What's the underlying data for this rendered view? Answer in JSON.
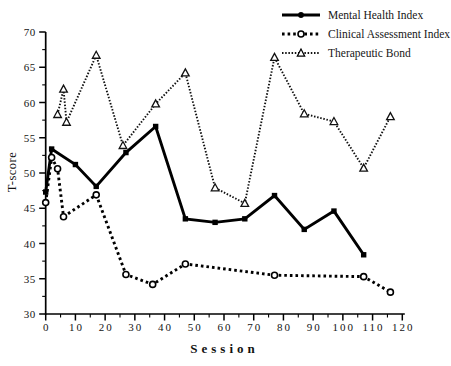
{
  "figure": {
    "background": "#ffffff",
    "ink": "#000000"
  },
  "chart_data": {
    "type": "line",
    "title": "",
    "xlabel": "Session",
    "ylabel": "T-score",
    "xlim": [
      0,
      120
    ],
    "ylim": [
      30,
      70
    ],
    "xticks": [
      0,
      10,
      20,
      30,
      40,
      50,
      60,
      70,
      80,
      90,
      100,
      110,
      120
    ],
    "yticks": [
      30,
      35,
      40,
      45,
      50,
      55,
      60,
      65,
      70
    ],
    "xminor_step": 5,
    "yminor_step": 2.5,
    "grid": false,
    "legend_position": "top-right",
    "series": [
      {
        "name": "Mental Health Index",
        "line": "solid-thick",
        "marker": "filled-square",
        "color": "#000000",
        "points": [
          [
            0,
            47.3
          ],
          [
            2,
            53.4
          ],
          [
            10,
            51.2
          ],
          [
            17,
            48.1
          ],
          [
            27,
            52.9
          ],
          [
            37,
            56.6
          ],
          [
            47,
            43.5
          ],
          [
            57,
            43.0
          ],
          [
            67,
            43.5
          ],
          [
            77,
            46.8
          ],
          [
            87,
            42.0
          ],
          [
            97,
            44.6
          ],
          [
            107,
            38.4
          ]
        ]
      },
      {
        "name": "Clinical Assessment Index",
        "line": "dotted-thick",
        "marker": "open-circle",
        "color": "#000000",
        "points": [
          [
            0,
            45.8
          ],
          [
            2,
            52.2
          ],
          [
            4,
            50.6
          ],
          [
            6,
            43.8
          ],
          [
            17,
            46.9
          ],
          [
            27,
            35.6
          ],
          [
            36,
            34.2
          ],
          [
            47,
            37.1
          ],
          [
            77,
            35.5
          ],
          [
            107,
            35.3
          ],
          [
            116,
            33.1
          ]
        ]
      },
      {
        "name": "Therapeutic Bond",
        "line": "dotted-fine",
        "marker": "open-triangle",
        "color": "#111111",
        "points": [
          [
            4,
            58.3
          ],
          [
            6,
            61.9
          ],
          [
            7,
            57.2
          ],
          [
            17,
            66.7
          ],
          [
            26,
            53.9
          ],
          [
            37,
            59.8
          ],
          [
            47,
            64.2
          ],
          [
            57,
            47.9
          ],
          [
            67,
            45.7
          ],
          [
            77,
            66.4
          ],
          [
            87,
            58.4
          ],
          [
            97,
            57.3
          ],
          [
            107,
            50.7
          ],
          [
            116,
            58.0
          ]
        ]
      }
    ]
  }
}
